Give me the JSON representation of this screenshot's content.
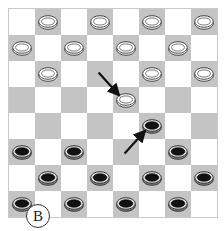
{
  "board": {
    "rows": 8,
    "cols": 8,
    "colors": {
      "light": "#ffffff",
      "dark": "#c4c4c4"
    },
    "pieces": [
      {
        "row": 0,
        "col": 1,
        "color": "white"
      },
      {
        "row": 0,
        "col": 3,
        "color": "white"
      },
      {
        "row": 0,
        "col": 5,
        "color": "white"
      },
      {
        "row": 0,
        "col": 7,
        "color": "white"
      },
      {
        "row": 1,
        "col": 0,
        "color": "white"
      },
      {
        "row": 1,
        "col": 2,
        "color": "white"
      },
      {
        "row": 1,
        "col": 4,
        "color": "white"
      },
      {
        "row": 1,
        "col": 6,
        "color": "white"
      },
      {
        "row": 2,
        "col": 1,
        "color": "white"
      },
      {
        "row": 2,
        "col": 5,
        "color": "white"
      },
      {
        "row": 2,
        "col": 7,
        "color": "white"
      },
      {
        "row": 3,
        "col": 4,
        "color": "white"
      },
      {
        "row": 4,
        "col": 5,
        "color": "black"
      },
      {
        "row": 5,
        "col": 0,
        "color": "black"
      },
      {
        "row": 5,
        "col": 2,
        "color": "black"
      },
      {
        "row": 5,
        "col": 6,
        "color": "black"
      },
      {
        "row": 6,
        "col": 1,
        "color": "black"
      },
      {
        "row": 6,
        "col": 3,
        "color": "black"
      },
      {
        "row": 6,
        "col": 5,
        "color": "black"
      },
      {
        "row": 6,
        "col": 7,
        "color": "black"
      },
      {
        "row": 7,
        "col": 0,
        "color": "black"
      },
      {
        "row": 7,
        "col": 2,
        "color": "black"
      },
      {
        "row": 7,
        "col": 4,
        "color": "black"
      },
      {
        "row": 7,
        "col": 6,
        "color": "black"
      }
    ],
    "moves": [
      {
        "from": {
          "row": 2,
          "col": 3
        },
        "to": {
          "row": 3,
          "col": 4
        },
        "piece": "white"
      },
      {
        "from": {
          "row": 5,
          "col": 4
        },
        "to": {
          "row": 4,
          "col": 5
        },
        "piece": "black"
      }
    ]
  },
  "label": "B"
}
